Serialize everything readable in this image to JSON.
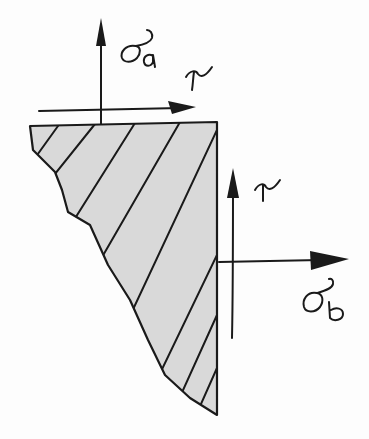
{
  "diagram": {
    "type": "hand-drawn stress element sketch",
    "colors": {
      "ink": "#1a1a1a",
      "hatch_fill": "#d9d9d9",
      "background": "#fdfdfd"
    },
    "body": {
      "shape": "wedge with hatched cross-section",
      "hatching": "diagonal lines"
    },
    "labels": {
      "sigma_a": {
        "symbol": "σ",
        "subscript": "a"
      },
      "tau_top": {
        "symbol": "τ"
      },
      "tau_right": {
        "symbol": "τ"
      },
      "sigma_b": {
        "symbol": "σ",
        "subscript": "b"
      }
    },
    "arrows": [
      {
        "name": "sigma-a-arrow",
        "direction": "up",
        "face": "top"
      },
      {
        "name": "tau-top-arrow",
        "direction": "right",
        "face": "top"
      },
      {
        "name": "tau-right-arrow",
        "direction": "up",
        "face": "right"
      },
      {
        "name": "sigma-b-arrow",
        "direction": "right",
        "face": "right"
      }
    ]
  }
}
